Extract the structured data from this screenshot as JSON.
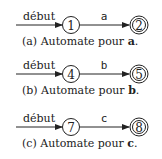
{
  "automata": [
    {
      "start_label": "début",
      "start_state": "1",
      "transition_symbol": "a",
      "accept_state": "2",
      "caption_prefix": "(a) Automate pour ",
      "caption_symbol": "a",
      "caption_suffix": "."
    },
    {
      "start_label": "début",
      "start_state": "4",
      "transition_symbol": "b",
      "accept_state": "5",
      "caption_prefix": "(b) Automate pour ",
      "caption_symbol": "b",
      "caption_suffix": "."
    },
    {
      "start_label": "début",
      "start_state": "7",
      "transition_symbol": "c",
      "accept_state": "8",
      "caption_prefix": "(c) Automate pour ",
      "caption_symbol": "c",
      "caption_suffix": "."
    }
  ],
  "colors": {
    "ink": "#222222",
    "background": "#ffffff"
  }
}
